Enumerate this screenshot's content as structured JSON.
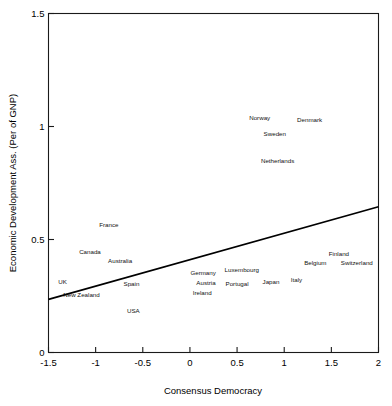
{
  "chart_data": {
    "type": "scatter",
    "title": "",
    "xlabel": "Consensus Democracy",
    "ylabel": "Economic Development Ass. (Per of GNP)",
    "xlim": [
      -1.5,
      2
    ],
    "ylim": [
      0,
      1.5
    ],
    "xticks": [
      -1.5,
      -1,
      -0.5,
      0,
      0.5,
      1,
      1.5,
      2
    ],
    "xticklabels": [
      "-1.5",
      "-1",
      "-0.5",
      "0",
      "0.5",
      "1",
      "1.5",
      "2"
    ],
    "yticks": [
      0,
      0.5,
      1,
      1.5
    ],
    "yticklabels": [
      "0",
      "0.5",
      "1",
      "1.5"
    ],
    "grid": false,
    "legend": null,
    "marker_style": "text-label-only",
    "points": [
      {
        "label": "Norway",
        "x": 0.74,
        "y": 1.03
      },
      {
        "label": "Denmark",
        "x": 1.27,
        "y": 1.02
      },
      {
        "label": "Sweden",
        "x": 0.9,
        "y": 0.96
      },
      {
        "label": "Netherlands",
        "x": 0.93,
        "y": 0.84
      },
      {
        "label": "France",
        "x": -0.86,
        "y": 0.555
      },
      {
        "label": "Canada",
        "x": -1.06,
        "y": 0.435
      },
      {
        "label": "Australia",
        "x": -0.74,
        "y": 0.395
      },
      {
        "label": "Finland",
        "x": 1.58,
        "y": 0.425
      },
      {
        "label": "Belgium",
        "x": 1.33,
        "y": 0.385
      },
      {
        "label": "Switzerland",
        "x": 1.77,
        "y": 0.385
      },
      {
        "label": "Luxembourg",
        "x": 0.55,
        "y": 0.355
      },
      {
        "label": "Germany",
        "x": 0.14,
        "y": 0.345
      },
      {
        "label": "UK",
        "x": -1.35,
        "y": 0.305
      },
      {
        "label": "Spain",
        "x": -0.62,
        "y": 0.295
      },
      {
        "label": "Austria",
        "x": 0.17,
        "y": 0.3
      },
      {
        "label": "Portugal",
        "x": 0.5,
        "y": 0.295
      },
      {
        "label": "Japan",
        "x": 0.86,
        "y": 0.305
      },
      {
        "label": "Italy",
        "x": 1.13,
        "y": 0.31
      },
      {
        "label": "Ireland",
        "x": 0.13,
        "y": 0.255
      },
      {
        "label": "New Zealand",
        "x": -1.15,
        "y": 0.245
      },
      {
        "label": "USA",
        "x": -0.6,
        "y": 0.175
      }
    ],
    "fit_line": {
      "type": "linear",
      "x_start": -1.5,
      "y_start": 0.235,
      "x_end": 2.0,
      "y_end": 0.645
    }
  },
  "colors": {
    "background": "#ffffff",
    "axis": "#1a1a1a",
    "text": "#000000",
    "fit_line": "#000000"
  }
}
